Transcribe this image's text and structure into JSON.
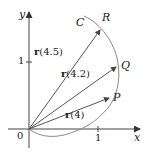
{
  "diagram": {
    "axes": {
      "x_label": "x",
      "y_label": "y",
      "origin_label": "0",
      "x_tick_label": "1",
      "y_tick_label": "1"
    },
    "curve_label": "C",
    "points": [
      {
        "name": "P",
        "label": "P"
      },
      {
        "name": "Q",
        "label": "Q"
      },
      {
        "name": "R",
        "label": "R"
      }
    ],
    "vectors": [
      {
        "fn": "r",
        "arg": "(4)",
        "to": "P"
      },
      {
        "fn": "r",
        "arg": "(4.2)",
        "to": "Q"
      },
      {
        "fn": "r",
        "arg": "(4.5)",
        "to": "R"
      }
    ],
    "colors": {
      "axis": "#444444",
      "curve": "#888888",
      "vector": "#555555",
      "text": "#222222"
    }
  }
}
